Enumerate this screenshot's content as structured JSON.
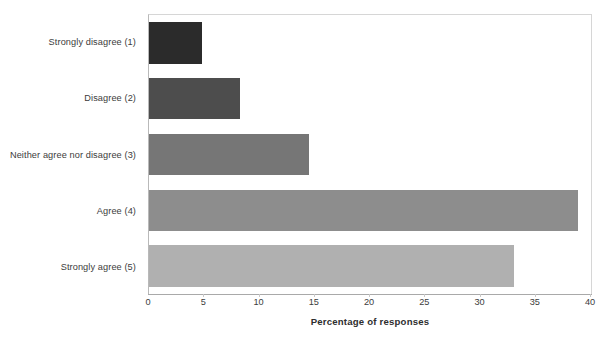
{
  "chart_data": {
    "type": "bar",
    "orientation": "horizontal",
    "title": "",
    "xlabel": "Percentage of responses",
    "ylabel": "",
    "categories": [
      "Strongly disagree (1)",
      "Disagree (2)",
      "Neither agree nor disagree (3)",
      "Agree (4)",
      "Strongly agree (5)"
    ],
    "values": [
      4.8,
      8.2,
      14.5,
      38.8,
      33.0
    ],
    "xlim": [
      0,
      40
    ],
    "xticks": [
      0,
      5,
      10,
      15,
      20,
      25,
      30,
      35,
      40
    ],
    "xtick_labels": [
      "0",
      "5",
      "10",
      "15",
      "20",
      "25",
      "30",
      "35",
      "40"
    ],
    "grid": false,
    "legend": "none",
    "bar_colors": [
      "#2b2b2b",
      "#4d4d4d",
      "#767676",
      "#8d8d8d",
      "#b0b0b0"
    ],
    "plot_border_color": "#d6d6d6",
    "axis_color": "#a9a9a9",
    "text_color": "#3c3c3c",
    "background": "#ffffff"
  }
}
